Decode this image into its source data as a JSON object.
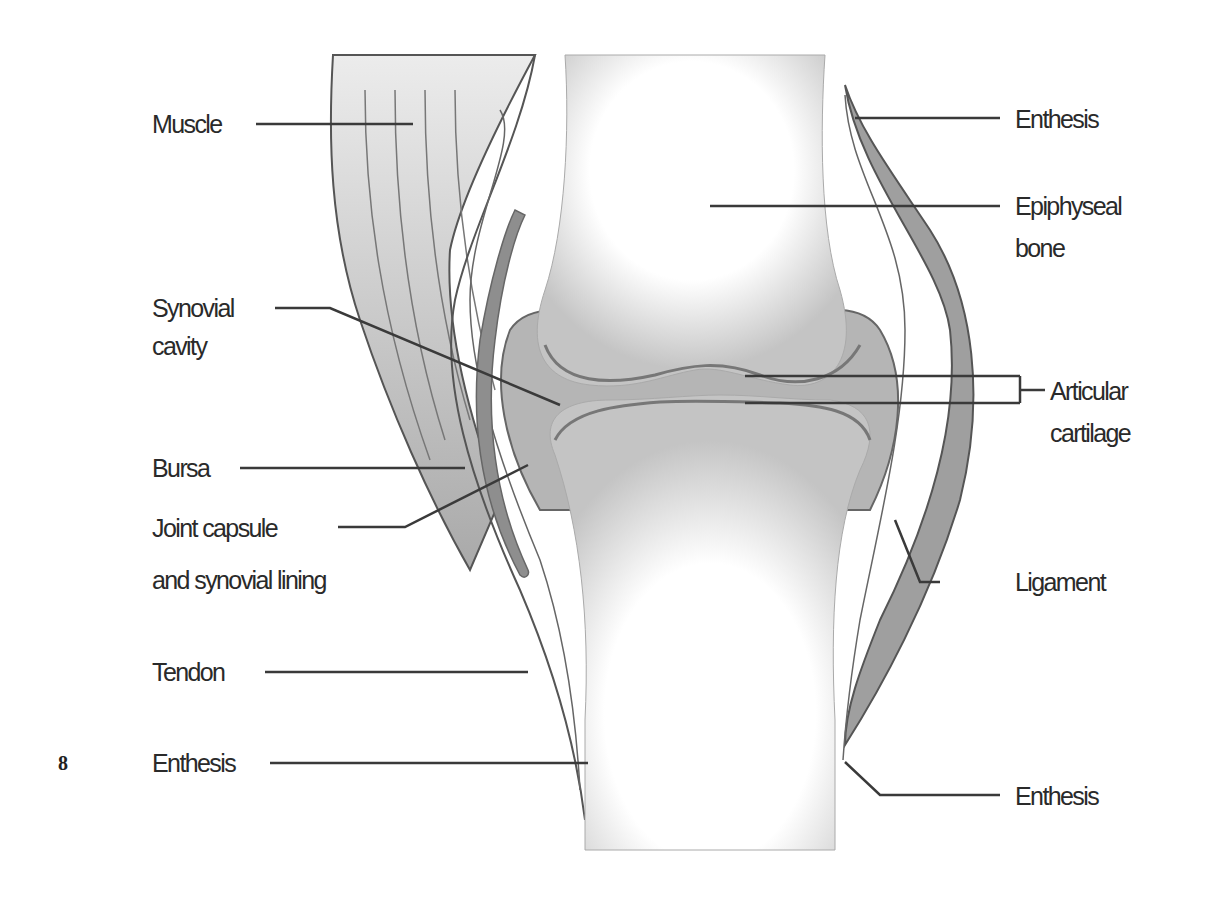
{
  "diagram": {
    "labels_left": [
      {
        "id": "muscle",
        "text": "Muscle"
      },
      {
        "id": "synovial-cavity",
        "line1": "Synovial",
        "line2": "cavity"
      },
      {
        "id": "bursa",
        "text": "Bursa"
      },
      {
        "id": "joint-capsule",
        "line1": "Joint capsule",
        "line2": "and synovial lining"
      },
      {
        "id": "tendon",
        "text": "Tendon"
      },
      {
        "id": "enthesis-bottom-left",
        "text": "Enthesis"
      }
    ],
    "labels_right": [
      {
        "id": "enthesis-top-right",
        "text": "Enthesis"
      },
      {
        "id": "epiphyseal-bone",
        "line1": "Epiphyseal",
        "line2": "bone"
      },
      {
        "id": "articular-cartilage",
        "line1": "Articular",
        "line2": "cartilage"
      },
      {
        "id": "ligament",
        "text": "Ligament"
      },
      {
        "id": "enthesis-bottom-right",
        "text": "Enthesis"
      }
    ],
    "page_number": "8"
  }
}
